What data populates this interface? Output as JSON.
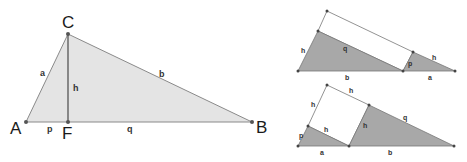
{
  "main_triangle": {
    "vertices": {
      "A": "A",
      "B": "B",
      "C": "C",
      "F": "F"
    },
    "segments": {
      "a": "a",
      "b": "b",
      "h": "h",
      "p": "p",
      "q": "q"
    },
    "fill_color": "#e4e4e4",
    "stroke_color": "#8a8a8a"
  },
  "top_right_figure": {
    "labels": {
      "h_left": "h",
      "q": "q",
      "b": "b",
      "p": "p",
      "h_right": "h",
      "a": "a"
    },
    "shaded_color": "#a8a8a8"
  },
  "bottom_right_figure": {
    "labels": {
      "h_top": "h",
      "h_left": "h",
      "p": "p",
      "h_inner": "h",
      "h_square_right": "h",
      "q": "q",
      "a": "a",
      "b": "b"
    },
    "shaded_color": "#a8a8a8"
  }
}
